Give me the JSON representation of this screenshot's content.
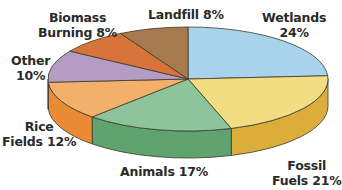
{
  "chart_data": {
    "type": "pie",
    "style": "3d",
    "title": "",
    "start_angle_deg": -90,
    "direction": "clockwise",
    "slices": [
      {
        "name": "Wetlands",
        "value": 24,
        "label_line1": "Wetlands",
        "label_line2": "24%",
        "top": "#a9d3ec",
        "side": "#8bbad8"
      },
      {
        "name": "Fossil Fuels",
        "value": 21,
        "label_line1": "Fossil",
        "label_line2": "Fuels 21%",
        "top": "#f3dd82",
        "side": "#dbae3c"
      },
      {
        "name": "Animals",
        "value": 17,
        "label_line1": "Animals 17%",
        "label_line2": "",
        "top": "#8ec49a",
        "side": "#5fa46f"
      },
      {
        "name": "Rice Fields",
        "value": 12,
        "label_line1": "Rice",
        "label_line2": "Fields 12%",
        "top": "#f2b06a",
        "side": "#e98a35"
      },
      {
        "name": "Other",
        "value": 10,
        "label_line1": "Other",
        "label_line2": "10%",
        "top": "#b59cc4",
        "side": "#9a80ab"
      },
      {
        "name": "Biomass Burning",
        "value": 8,
        "label_line1": "Biomass",
        "label_line2": "Burning 8%",
        "top": "#d8733a",
        "side": "#c05e2a"
      },
      {
        "name": "Landfill",
        "value": 8,
        "label_line1": "Landfill 8%",
        "label_line2": "",
        "top": "#a87b4f",
        "side": "#8d623b"
      }
    ]
  },
  "labels": {
    "wetlands": {
      "l1": "Wetlands",
      "l2": "24%"
    },
    "fossil": {
      "l1": "Fossil",
      "l2": "Fuels 21%"
    },
    "animals": {
      "l1": "Animals 17%"
    },
    "rice": {
      "l1": "Rice",
      "l2": "Fields 12%"
    },
    "other": {
      "l1": "Other",
      "l2": "10%"
    },
    "biomass": {
      "l1": "Biomass",
      "l2": "Burning 8%"
    },
    "landfill": {
      "l1": "Landfill 8%"
    }
  }
}
